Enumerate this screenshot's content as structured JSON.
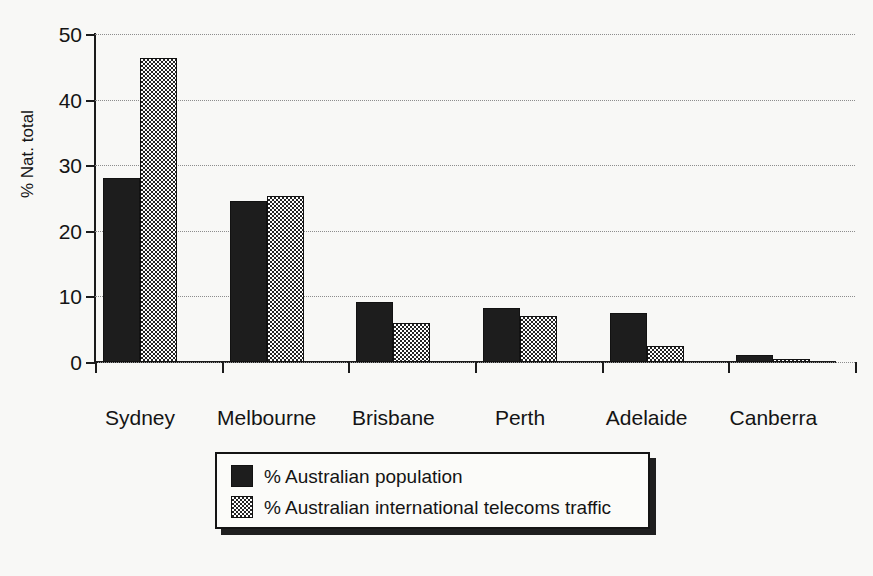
{
  "chart_data": {
    "type": "bar",
    "title": "",
    "subtitle": "",
    "xlabel": "",
    "ylabel": "% Nat. total",
    "ylim": [
      0,
      50
    ],
    "yticks": [
      0,
      10,
      20,
      30,
      40,
      50
    ],
    "ytick_labels": [
      "0",
      "10",
      "20",
      "30",
      "40",
      "50"
    ],
    "grid": "horizontal dotted gridlines at each y tick",
    "legend_position": "below plot, centered",
    "categories": [
      "Sydney",
      "Melbourne",
      "Brisbane",
      "Perth",
      "Adelaide",
      "Canberra"
    ],
    "series": [
      {
        "name": "% Australian population",
        "fill": "solid-black",
        "color": "#1d1d1d",
        "values": [
          28.0,
          24.6,
          9.2,
          8.2,
          7.4,
          1.0
        ]
      },
      {
        "name": "% Australian international telecoms traffic",
        "fill": "checkerboard",
        "color": "#242424",
        "values": [
          46.3,
          25.3,
          6.0,
          7.0,
          2.5,
          0.4
        ]
      }
    ],
    "annotations": []
  },
  "legend": {
    "entries": [
      {
        "label": "% Australian population",
        "swatch": "solid-black-swatch"
      },
      {
        "label": "% Australian international telecoms traffic",
        "swatch": "checkerboard-swatch"
      }
    ]
  }
}
